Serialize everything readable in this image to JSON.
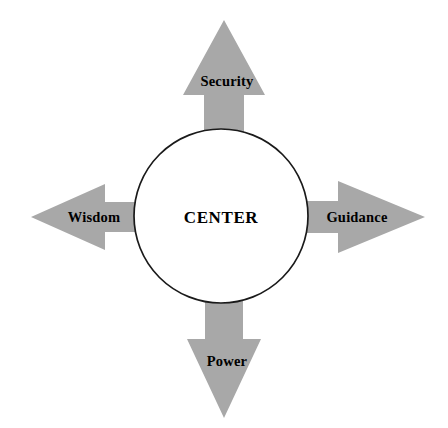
{
  "diagram": {
    "type": "radial-arrow-diagram",
    "background_color": "#ffffff",
    "arrow_fill_color": "#a8a8a8",
    "outline_color": "#1a1a1a",
    "text_color": "#000000",
    "center": {
      "label": "CENTER",
      "shape": "circle",
      "cx": 221,
      "cy": 216,
      "r": 87
    },
    "spokes": [
      {
        "id": "security",
        "label": "Security",
        "direction": "up",
        "tip": {
          "x": 224,
          "y": 20
        },
        "head_base_y": 95,
        "head_half_width": 41,
        "shaft_half_width": 20
      },
      {
        "id": "guidance",
        "label": "Guidance",
        "direction": "right",
        "tip": {
          "x": 425,
          "y": 217
        },
        "head_base_x": 338,
        "head_half_width": 36,
        "shaft_half_width": 16
      },
      {
        "id": "wisdom",
        "label": "Wisdom",
        "direction": "left",
        "tip": {
          "x": 31,
          "y": 217
        },
        "head_base_x": 105,
        "head_half_width": 33,
        "shaft_half_width": 15
      },
      {
        "id": "power",
        "label": "Power",
        "direction": "down",
        "tip": {
          "x": 224,
          "y": 418
        },
        "head_base_y": 339,
        "head_half_width": 37,
        "shaft_half_width": 19
      }
    ]
  }
}
